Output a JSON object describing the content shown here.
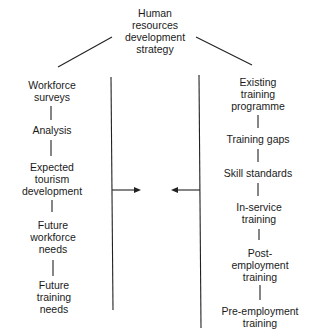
{
  "diagram": {
    "root": {
      "label_lines": [
        "Human",
        "resources",
        "development",
        "strategy"
      ]
    },
    "left_branch": {
      "nodes": [
        {
          "label_lines": [
            "Workforce",
            "surveys"
          ]
        },
        {
          "label_lines": [
            "Analysis"
          ]
        },
        {
          "label_lines": [
            "Expected",
            "tourism",
            "development"
          ]
        },
        {
          "label_lines": [
            "Future",
            "workforce",
            "needs"
          ]
        },
        {
          "label_lines": [
            "Future",
            "training",
            "needs"
          ]
        }
      ]
    },
    "right_branch": {
      "nodes": [
        {
          "label_lines": [
            "Existing",
            "training",
            "programme"
          ]
        },
        {
          "label_lines": [
            "Training gaps"
          ]
        },
        {
          "label_lines": [
            "Skill standards"
          ]
        },
        {
          "label_lines": [
            "In-service",
            "training"
          ]
        },
        {
          "label_lines": [
            "Post-",
            "employment",
            "training"
          ]
        },
        {
          "label_lines": [
            "Pre-employment",
            "training"
          ]
        }
      ]
    },
    "connectors": {
      "arrow_left_to_center": "right-arrow",
      "arrow_right_to_center": "left-arrow"
    },
    "colors": {
      "line": "#222222",
      "text": "#1a1a1a",
      "background": "#ffffff"
    }
  }
}
